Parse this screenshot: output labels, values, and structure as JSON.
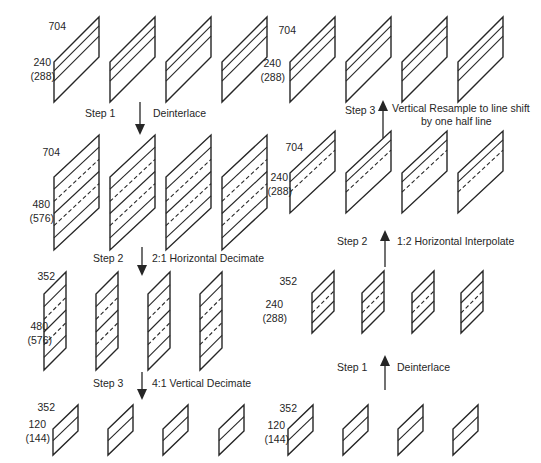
{
  "palette": {
    "ink": "#262626",
    "background": "#ffffff"
  },
  "left_flow": {
    "direction": "down",
    "groups": [
      {
        "width_label": "704",
        "lines_label": "240",
        "lines_label_alt": "(288)"
      },
      {
        "width_label": "704",
        "lines_label": "480",
        "lines_label_alt": "(576)"
      },
      {
        "width_label": "352",
        "lines_label": "480",
        "lines_label_alt": "(576)"
      },
      {
        "width_label": "352",
        "lines_label": "120",
        "lines_label_alt": "(144)"
      }
    ],
    "steps": [
      {
        "label": "Step 1",
        "caption": "Deinterlace"
      },
      {
        "label": "Step 2",
        "caption": "2:1 Horizontal Decimate"
      },
      {
        "label": "Step 3",
        "caption": "4:1 Vertical Decimate"
      }
    ]
  },
  "right_flow": {
    "direction": "up",
    "groups": [
      {
        "width_label": "704",
        "lines_label": "240",
        "lines_label_alt": "(288)"
      },
      {
        "width_label": "704",
        "lines_label": "240",
        "lines_label_alt": "(288)"
      },
      {
        "width_label": "352",
        "lines_label": "240",
        "lines_label_alt": "(288)"
      },
      {
        "width_label": "352",
        "lines_label": "120",
        "lines_label_alt": "(144)"
      }
    ],
    "steps": [
      {
        "label": "Step 3",
        "caption_line1": "Vertical Resample to line shift",
        "caption_line2": "by one half line"
      },
      {
        "label": "Step 2",
        "caption": "1:2 Horizontal Interpolate"
      },
      {
        "label": "Step 1",
        "caption": "Deinterlace"
      }
    ]
  }
}
